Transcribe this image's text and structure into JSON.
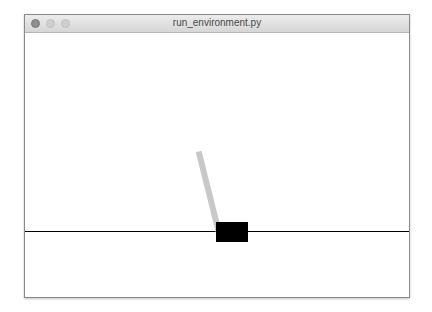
{
  "window": {
    "title": "run_environment.py",
    "traffic_lights": [
      "close",
      "minimize",
      "zoom"
    ]
  },
  "scene": {
    "environment": "cartpole",
    "cart_color": "#000000",
    "pole_color": "#c8c8c8",
    "track_color": "#000000",
    "pole_angle_deg": -14
  }
}
